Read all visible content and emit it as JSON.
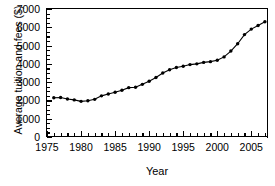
{
  "chart_data": {
    "type": "line",
    "title": "",
    "xlabel": "Year",
    "ylabel": "Average tuition and fees ($)",
    "xlim": [
      1975,
      2007.6
    ],
    "ylim": [
      0,
      7000
    ],
    "yticks": [
      0,
      1000,
      2000,
      3000,
      4000,
      5000,
      6000,
      7000
    ],
    "ytick_labels": [
      "0",
      "1000",
      "2000",
      "3000",
      "4000",
      "5000",
      "6000",
      "7000"
    ],
    "xticks": [
      1975,
      1980,
      1985,
      1990,
      1995,
      2000,
      2005
    ],
    "xtick_labels": [
      "1975",
      "1980",
      "1985",
      "1990",
      "1995",
      "2000",
      "2005"
    ],
    "xminor_step": 1,
    "yminor_step": 250,
    "grid": false,
    "legend": null,
    "marker": "filled-circle",
    "line_color": "#000000",
    "x": [
      1976,
      1977,
      1978,
      1979,
      1980,
      1981,
      1982,
      1983,
      1984,
      1985,
      1986,
      1987,
      1988,
      1989,
      1990,
      1991,
      1992,
      1993,
      1994,
      1995,
      1996,
      1997,
      1998,
      1999,
      2000,
      2001,
      2002,
      2003,
      2004,
      2005,
      2006,
      2007
    ],
    "values": [
      2150,
      2160,
      2080,
      2030,
      1950,
      1980,
      2060,
      2250,
      2350,
      2450,
      2560,
      2700,
      2720,
      2880,
      3050,
      3250,
      3500,
      3680,
      3800,
      3870,
      3960,
      4000,
      4080,
      4120,
      4200,
      4380,
      4700,
      5100,
      5600,
      5900,
      6100,
      6300
    ]
  },
  "figure": {
    "background": "#ffffff",
    "axis_color": "#000000"
  }
}
